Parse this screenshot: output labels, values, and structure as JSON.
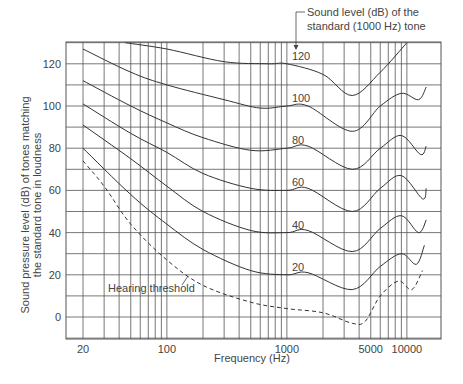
{
  "chart_data": {
    "type": "line",
    "title": "",
    "xlabel": "Frequency (Hz)",
    "ylabel": "Sound pressure level (dB) of tones matching the standard tone in loudness",
    "ylabel_lines": [
      "Sound pressure level (dB) of tones matching",
      "the standard tone in loudness"
    ],
    "xscale": "log",
    "xlim": [
      17,
      20000
    ],
    "ylim": [
      -10,
      130
    ],
    "grid": true,
    "x_tick_labels": [
      {
        "value": 20,
        "label": "20"
      },
      {
        "value": 100,
        "label": "100"
      },
      {
        "value": 1000,
        "label": "1000"
      },
      {
        "value": 5000,
        "label": "5000"
      },
      {
        "value": 10000,
        "label": "10000"
      }
    ],
    "y_ticks": [
      0,
      20,
      40,
      60,
      80,
      100,
      120
    ],
    "y_gridlines": [
      -10,
      0,
      10,
      20,
      30,
      40,
      50,
      60,
      70,
      80,
      90,
      100,
      110,
      120,
      130
    ],
    "x_gridlines": [
      20,
      30,
      40,
      50,
      60,
      70,
      80,
      90,
      100,
      200,
      300,
      400,
      500,
      600,
      700,
      800,
      900,
      1000,
      2000,
      3000,
      4000,
      5000,
      6000,
      7000,
      8000,
      9000,
      10000,
      20000
    ],
    "annotation": {
      "text_lines": [
        "Sound level (dB) of the",
        "standard (1000 Hz) tone"
      ]
    },
    "series": [
      {
        "name": "120",
        "style": "solid",
        "label": "120",
        "x": [
          45,
          100,
          300,
          700,
          1000,
          2000,
          3500,
          6000,
          10000
        ],
        "y": [
          130,
          127,
          121,
          120,
          120,
          115,
          105,
          116,
          130
        ]
      },
      {
        "name": "100",
        "style": "solid",
        "label": "100",
        "x": [
          20,
          50,
          100,
          300,
          600,
          1000,
          1500,
          3500,
          6000,
          9000,
          12500,
          14500
        ],
        "y": [
          127,
          116,
          110,
          103,
          99,
          100,
          100,
          88,
          100,
          106,
          103,
          109
        ]
      },
      {
        "name": "80",
        "style": "solid",
        "label": "80",
        "x": [
          20,
          50,
          100,
          200,
          500,
          1000,
          1500,
          3500,
          6000,
          9000,
          13000,
          14500
        ],
        "y": [
          112,
          100,
          92,
          85,
          79,
          80,
          81,
          70,
          80,
          86,
          77,
          81
        ]
      },
      {
        "name": "60",
        "style": "solid",
        "label": "60",
        "x": [
          20,
          50,
          100,
          200,
          500,
          1000,
          1500,
          3500,
          6000,
          9000,
          13500,
          14500
        ],
        "y": [
          101,
          87,
          78,
          68,
          61,
          60,
          61,
          50,
          61,
          67,
          56,
          61
        ]
      },
      {
        "name": "40",
        "style": "solid",
        "label": "40",
        "x": [
          20,
          50,
          100,
          200,
          500,
          1000,
          1500,
          3500,
          6000,
          9000,
          12500,
          14500
        ],
        "y": [
          91,
          75,
          62,
          50,
          41,
          40,
          41,
          31,
          42,
          48,
          40,
          46
        ]
      },
      {
        "name": "20",
        "style": "solid",
        "label": "20",
        "x": [
          20,
          50,
          100,
          200,
          500,
          1000,
          1500,
          3500,
          6000,
          9000,
          12000,
          14000
        ],
        "y": [
          80,
          58,
          44,
          32,
          22,
          20,
          21,
          13,
          24,
          30,
          25,
          34
        ]
      },
      {
        "name": "Hearing threshold",
        "style": "dashed",
        "label": "Hearing threshold",
        "x": [
          20,
          30,
          50,
          100,
          200,
          500,
          1000,
          2000,
          3500,
          4500,
          6000,
          8500,
          11000,
          13500
        ],
        "y": [
          74,
          62,
          44,
          27,
          15,
          7,
          4,
          2,
          -3,
          -2,
          10,
          17,
          13,
          22
        ]
      }
    ]
  },
  "colors": {
    "grid": "#555555",
    "curve": "#333333",
    "text": "#444444",
    "background": "#ffffff"
  }
}
